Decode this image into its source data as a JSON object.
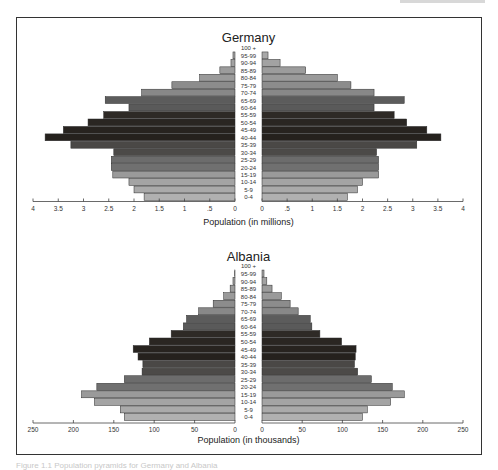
{
  "chart_data": [
    {
      "type": "bar",
      "subtype": "population-pyramid",
      "title": "Germany",
      "xlabel": "Population (in millions)",
      "ylabel": "",
      "categories": [
        "100 +",
        "95-99",
        "90-94",
        "85-89",
        "80-84",
        "75-79",
        "70-74",
        "65-69",
        "60-64",
        "55-59",
        "50-54",
        "45-49",
        "40-44",
        "35-39",
        "30-34",
        "25-29",
        "20-24",
        "15-19",
        "10-14",
        "5-9",
        "0-4"
      ],
      "series": [
        {
          "name": "Left",
          "values": [
            0,
            0.04,
            0.08,
            0.3,
            0.7,
            1.25,
            1.85,
            2.57,
            2.1,
            2.6,
            2.91,
            3.4,
            3.76,
            3.25,
            2.4,
            2.45,
            2.45,
            2.42,
            2.1,
            2.0,
            1.8
          ]
        },
        {
          "name": "Right",
          "values": [
            0,
            0.12,
            0.36,
            0.87,
            1.5,
            1.77,
            2.23,
            2.83,
            2.23,
            2.63,
            2.88,
            3.28,
            3.56,
            3.08,
            2.28,
            2.32,
            2.32,
            2.32,
            2.0,
            1.9,
            1.7
          ]
        }
      ],
      "xlim": [
        0,
        4
      ],
      "left_ticks": [
        "4",
        "3.5",
        "3",
        "2.5",
        "2",
        "1.5",
        "1",
        ".5",
        "0"
      ],
      "right_ticks": [
        "0",
        ".5",
        "1",
        "1.5",
        "2",
        "2.5",
        "3",
        "3.5",
        "4"
      ],
      "tick_values": [
        4,
        3.5,
        3,
        2.5,
        2,
        1.5,
        1,
        0.5,
        0
      ],
      "grid": false,
      "legend": "none"
    },
    {
      "type": "bar",
      "subtype": "population-pyramid",
      "title": "Albania",
      "xlabel": "Population (in thousands)",
      "ylabel": "",
      "categories": [
        "100 +",
        "95-99",
        "90-94",
        "85-89",
        "80-84",
        "75-79",
        "70-74",
        "65-69",
        "60-64",
        "55-59",
        "50-54",
        "45-49",
        "40-44",
        "35-39",
        "30-34",
        "25-29",
        "20-24",
        "15-19",
        "10-14",
        "5-9",
        "0-4"
      ],
      "series": [
        {
          "name": "Left",
          "values": [
            0,
            0.5,
            2.5,
            6,
            14,
            27,
            45,
            60,
            64,
            79,
            106,
            126,
            120,
            114,
            115,
            137,
            171,
            190,
            174,
            142,
            137
          ]
        },
        {
          "name": "Right",
          "values": [
            0,
            2.5,
            6,
            12.5,
            24,
            35,
            45,
            60,
            62,
            72,
            99,
            117,
            116,
            115,
            119,
            136,
            162,
            177,
            160,
            131,
            125
          ]
        }
      ],
      "xlim": [
        0,
        250
      ],
      "left_ticks": [
        "250",
        "200",
        "150",
        "100",
        "50",
        "0"
      ],
      "right_ticks": [
        "0",
        "50",
        "100",
        "150",
        "200",
        "250"
      ],
      "tick_values": [
        250,
        200,
        150,
        100,
        50,
        0
      ],
      "grid": false,
      "legend": "none"
    }
  ],
  "row_shades": [
    "#b4b4b4",
    "#a8a8a8",
    "#a2a2a2",
    "#9c9c9c",
    "#9a9a9a",
    "#8c8c8c",
    "#888888",
    "#5c5c5c",
    "#5a5a5a",
    "#2e2a26",
    "#2a2622",
    "#27231f",
    "#25211d",
    "#4a4846",
    "#4c4a48",
    "#6c6c6c",
    "#707070",
    "#9a9a9a",
    "#a4a4a4",
    "#aaaaaa",
    "#b0b0b0"
  ],
  "caption": "Figure 1.1 Population pyramids for Germany and Albania"
}
